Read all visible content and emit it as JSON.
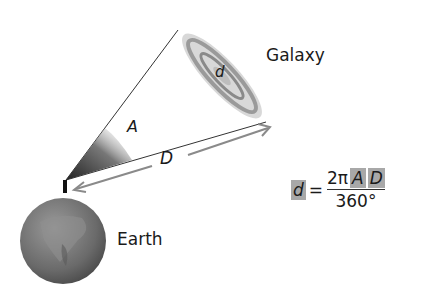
{
  "labels": {
    "galaxy": "Galaxy",
    "earth": "Earth",
    "angle": "A",
    "distance": "D",
    "diameter": "d"
  },
  "formula": {
    "lhs": "d",
    "equals": "=",
    "numerator_const": "2π",
    "numerator_A": "A",
    "numerator_D": "D",
    "denominator": "360°"
  },
  "colors": {
    "highlight": "#a8a8a8",
    "arrow": "#8a8a8a",
    "earth": "#6e6e6e"
  }
}
